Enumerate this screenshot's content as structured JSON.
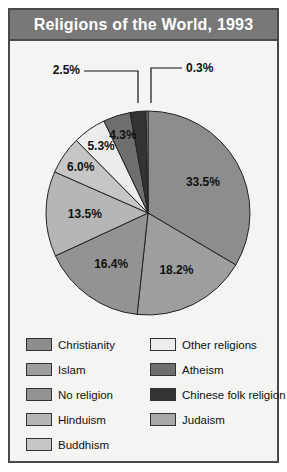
{
  "header": {
    "title": "Religions of the World, 1993"
  },
  "colors": {
    "frame": "#4a4a4a",
    "title_bar": "#787878",
    "title_text": "#ffffff",
    "background": "#f4f4f2",
    "slice_stroke": "#222222"
  },
  "chart_data": {
    "type": "pie",
    "title": "Religions of the World, 1993",
    "xlabel": "",
    "ylabel": "",
    "units": "percent",
    "legend_position": "bottom",
    "grid": false,
    "start_angle_deg": 90,
    "direction": "clockwise",
    "categories": [
      "Christianity",
      "Islam",
      "No religion",
      "Hinduism",
      "Buddhism",
      "Other religions",
      "Atheism",
      "Chinese folk religion",
      "Judaism"
    ],
    "values": [
      33.5,
      18.2,
      16.4,
      13.5,
      6.0,
      5.3,
      4.3,
      2.5,
      0.3
    ],
    "labels": [
      "33.5%",
      "18.2%",
      "16.4%",
      "13.5%",
      "6.0%",
      "5.3%",
      "4.3%",
      "2.5%",
      "0.3%"
    ],
    "slice_colors": [
      "#8d8d8d",
      "#9e9e9e",
      "#939393",
      "#b6b6b6",
      "#c6c6c6",
      "#ededed",
      "#6e6e6e",
      "#333333",
      "#a8a8a8"
    ]
  },
  "legend": {
    "left_column": [
      {
        "label": "Christianity",
        "color": "#8d8d8d"
      },
      {
        "label": "Islam",
        "color": "#9e9e9e"
      },
      {
        "label": "No religion",
        "color": "#939393"
      },
      {
        "label": "Hinduism",
        "color": "#b6b6b6"
      },
      {
        "label": "Buddhism",
        "color": "#c6c6c6"
      }
    ],
    "right_column": [
      {
        "label": "Other religions",
        "color": "#ededed"
      },
      {
        "label": "Atheism",
        "color": "#6e6e6e"
      },
      {
        "label": "Chinese folk religion",
        "color": "#333333"
      },
      {
        "label": "Judaism",
        "color": "#a8a8a8"
      }
    ]
  },
  "callouts": {
    "small_left": "2.5%",
    "small_right": "0.3%"
  }
}
